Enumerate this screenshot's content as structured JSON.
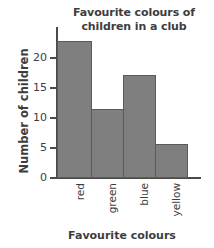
{
  "chart_data": {
    "type": "bar",
    "title": "Favourite colours of children in a club",
    "title_lines": [
      "Favourite colours of",
      "children in a club"
    ],
    "categories": [
      "red",
      "green",
      "blue",
      "yellow"
    ],
    "values": [
      20,
      10,
      15,
      5
    ],
    "xlabel": "Favourite colours",
    "ylabel": "Number of children",
    "ylim": [
      0,
      22
    ],
    "yticks": [
      0,
      5,
      10,
      15,
      20
    ],
    "ytick_labels": [
      "0",
      "5",
      "10",
      "15",
      "20"
    ],
    "grid": false,
    "legend": false,
    "bars_adjacent": true,
    "colors": {
      "bar_fill": "#7f7f7f",
      "bar_edge": "#5a5a5a",
      "axis": "#4a4a4a",
      "text": "#3d3d3d",
      "background": "#ffffff"
    }
  }
}
